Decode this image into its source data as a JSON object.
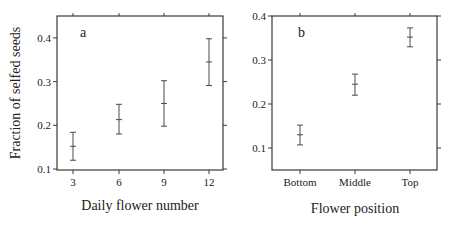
{
  "chart_data": [
    {
      "type": "scatter",
      "panel_label": "a",
      "xlabel": "Daily flower number",
      "ylabel": "Fraction of selfed seeds",
      "categories": [
        "3",
        "6",
        "9",
        "12"
      ],
      "yticks": [
        "0.1",
        "0.2",
        "0.3",
        "0.4"
      ],
      "ylim": [
        0.1,
        0.45
      ],
      "grid": false,
      "series": [
        {
          "name": "Fraction of selfed seeds",
          "values": [
            0.152,
            0.213,
            0.25,
            0.345
          ],
          "upper": [
            0.184,
            0.248,
            0.302,
            0.398
          ],
          "lower": [
            0.12,
            0.18,
            0.198,
            0.291
          ]
        }
      ]
    },
    {
      "type": "scatter",
      "panel_label": "b",
      "xlabel": "Flower position",
      "ylabel": "",
      "categories": [
        "Bottom",
        "Middle",
        "Top"
      ],
      "yticks": [
        "0.1",
        "0.2",
        "0.3",
        "0.4"
      ],
      "ylim": [
        0.05,
        0.4
      ],
      "grid": false,
      "series": [
        {
          "name": "Fraction of selfed seeds",
          "values": [
            0.13,
            0.245,
            0.352
          ],
          "upper": [
            0.152,
            0.268,
            0.373
          ],
          "lower": [
            0.107,
            0.22,
            0.33
          ]
        }
      ]
    }
  ]
}
